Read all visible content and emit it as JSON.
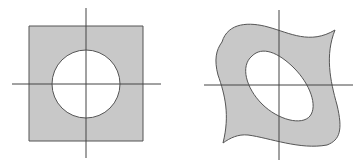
{
  "diagram": {
    "panels": [
      {
        "id": "left",
        "description": "square region with circular hole, centered on axes",
        "region_shape": "square",
        "hole_shape": "circle"
      },
      {
        "id": "right",
        "description": "warped (transformed) region with elliptical hole, centered on axes",
        "region_shape": "curved quadrilateral",
        "hole_shape": "tilted ellipse"
      }
    ],
    "colors": {
      "fill": "#c8c8c8",
      "stroke": "#555555",
      "axis": "#444444",
      "hole": "#ffffff",
      "background": "#ffffff"
    }
  }
}
